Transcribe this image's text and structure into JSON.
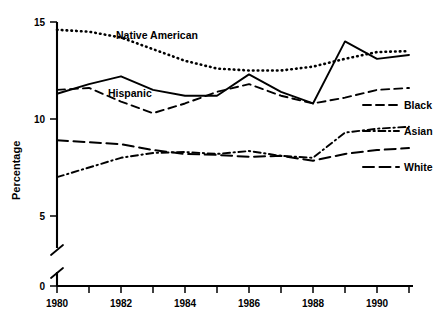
{
  "chart_data": {
    "type": "line",
    "title": "",
    "subtitle": "",
    "xlabel": "",
    "ylabel": "Percentage",
    "x": [
      1980,
      1981,
      1982,
      1983,
      1984,
      1985,
      1986,
      1987,
      1988,
      1989,
      1990,
      1991
    ],
    "xlim": [
      1980,
      1991.4
    ],
    "ylim": [
      5,
      15
    ],
    "y_axis_break": true,
    "y_break_between": [
      0,
      5
    ],
    "y_ticks": [
      0,
      5,
      10,
      15
    ],
    "y_tick_labels": [
      "0",
      "5",
      "10",
      "15"
    ],
    "x_ticks": [
      1980,
      1981,
      1982,
      1983,
      1984,
      1985,
      1986,
      1987,
      1988,
      1989,
      1990,
      1991
    ],
    "x_tick_labels": [
      "1980",
      "",
      "1982",
      "",
      "1984",
      "",
      "1986",
      "",
      "1988",
      "",
      "1990",
      ""
    ],
    "x_major_labels": [
      "1980",
      "1982",
      "1984",
      "1986",
      "1988",
      "1990"
    ],
    "grid": false,
    "legend_position": "right-inline",
    "series": [
      {
        "name": "Native American",
        "label_placement": "inline",
        "style": "dotted",
        "color": "#000000",
        "values": [
          14.6,
          14.5,
          14.2,
          13.6,
          13.0,
          12.6,
          12.5,
          12.5,
          12.7,
          13.1,
          13.45,
          13.5
        ]
      },
      {
        "name": "Hispanic",
        "label_placement": "inline",
        "style": "solid",
        "color": "#000000",
        "values": [
          11.3,
          11.8,
          12.2,
          11.5,
          11.2,
          11.2,
          12.3,
          11.4,
          10.8,
          14.0,
          13.1,
          13.3
        ]
      },
      {
        "name": "Black",
        "label_placement": "legend",
        "style": "dashed",
        "color": "#000000",
        "values": [
          11.5,
          11.6,
          10.9,
          10.3,
          10.8,
          11.4,
          11.8,
          11.2,
          10.8,
          11.1,
          11.5,
          11.6
        ]
      },
      {
        "name": "Asian",
        "label_placement": "legend",
        "style": "dash-dot",
        "color": "#000000",
        "values": [
          7.0,
          7.5,
          8.0,
          8.25,
          8.3,
          8.2,
          8.35,
          8.1,
          8.0,
          9.3,
          9.5,
          9.6
        ]
      },
      {
        "name": "White",
        "label_placement": "legend",
        "style": "long-dash",
        "color": "#000000",
        "values": [
          8.9,
          8.8,
          8.7,
          8.4,
          8.2,
          8.15,
          8.05,
          8.1,
          7.85,
          8.2,
          8.4,
          8.5
        ]
      }
    ],
    "inline_annotations": [
      {
        "text": "Native American",
        "x": 1983.2,
        "y": 14.25
      },
      {
        "text": "Hispanic",
        "x": 1982.1,
        "y": 11.85
      }
    ],
    "legend_entries": [
      {
        "label": "Black",
        "style": "dashed"
      },
      {
        "label": "Asian",
        "style": "dash-dot"
      },
      {
        "label": "White",
        "style": "long-dash"
      }
    ]
  }
}
